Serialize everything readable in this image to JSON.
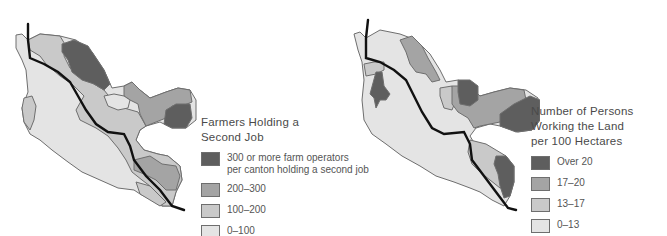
{
  "maps": [
    {
      "id": "farmers-second-job",
      "legend": {
        "title_line1": "Farmers Holding a",
        "title_line2": "Second Job",
        "items": [
          {
            "label_line1": "300 or more farm operators",
            "label_line2": "per canton holding a second job",
            "color": "#5e5e5e"
          },
          {
            "label_line1": "200–300",
            "label_line2": "",
            "color": "#a4a4a4"
          },
          {
            "label_line1": "100–200",
            "label_line2": "",
            "color": "#c9c9c9"
          },
          {
            "label_line1": "0–100",
            "label_line2": "",
            "color": "#e4e4e4"
          }
        ]
      }
    },
    {
      "id": "persons-working-land",
      "legend": {
        "title_line1": "Number of Persons",
        "title_line2": "Working the Land",
        "title_line3": "per 100 Hectares",
        "items": [
          {
            "label_line1": "Over 20",
            "color": "#5e5e5e"
          },
          {
            "label_line1": "17–20",
            "color": "#a4a4a4"
          },
          {
            "label_line1": "13–17",
            "color": "#c9c9c9"
          },
          {
            "label_line1": "0–13",
            "color": "#e4e4e4"
          }
        ]
      }
    }
  ],
  "colors": {
    "dark": "#5e5e5e",
    "medium": "#a4a4a4",
    "light": "#c9c9c9",
    "lightest": "#e4e4e4",
    "border": "#6e6e6e",
    "river": "#111111"
  }
}
